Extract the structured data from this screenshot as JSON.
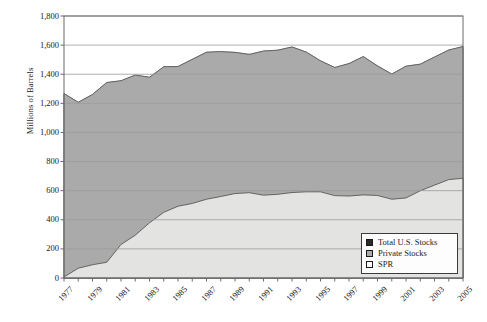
{
  "chart_data": {
    "type": "area",
    "stacked": true,
    "title": "",
    "xlabel": "",
    "ylabel": "Millions of Barrels",
    "ylim": [
      0,
      1800
    ],
    "ytick_step": 200,
    "yticks": [
      "0",
      "200",
      "400",
      "600",
      "800",
      "1,000",
      "1,200",
      "1,400",
      "1,600",
      "1,800"
    ],
    "grid": "horizontal",
    "legend_position": "bottom-right",
    "x": [
      1977,
      1978,
      1979,
      1980,
      1981,
      1982,
      1983,
      1984,
      1985,
      1986,
      1987,
      1988,
      1989,
      1990,
      1991,
      1992,
      1993,
      1994,
      1995,
      1996,
      1997,
      1998,
      1999,
      2000,
      2001,
      2002,
      2003,
      2004,
      2005
    ],
    "xtick_labels": [
      "1977",
      "1979",
      "1981",
      "1983",
      "1985",
      "1987",
      "1989",
      "1991",
      "1993",
      "1995",
      "1997",
      "1999",
      "2001",
      "2003",
      "2005"
    ],
    "xtick_label_years": [
      1977,
      1979,
      1981,
      1983,
      1985,
      1987,
      1989,
      1991,
      1993,
      1995,
      1997,
      1999,
      2001,
      2003,
      2005
    ],
    "series": [
      {
        "name": "SPR",
        "color": "#e3e3e1",
        "values": [
          7,
          67,
          91,
          108,
          230,
          294,
          379,
          451,
          493,
          512,
          541,
          560,
          580,
          586,
          569,
          575,
          587,
          592,
          592,
          566,
          563,
          571,
          567,
          541,
          550,
          599,
          638,
          676,
          685
        ]
      },
      {
        "name": "Private Stocks",
        "color": "#aaaaaa",
        "values": [
          1260,
          1140,
          1170,
          1235,
          1125,
          1100,
          1000,
          1000,
          960,
          990,
          1010,
          995,
          970,
          950,
          990,
          990,
          1000,
          960,
          900,
          880,
          910,
          950,
          890,
          860,
          905,
          870,
          880,
          890,
          905
        ]
      },
      {
        "name": "Total U.S. Stocks",
        "color": "#4a4a4a",
        "values": [
          1267,
          1207,
          1261,
          1343,
          1355,
          1394,
          1379,
          1451,
          1453,
          1502,
          1551,
          1555,
          1550,
          1536,
          1559,
          1565,
          1587,
          1552,
          1492,
          1446,
          1473,
          1521,
          1457,
          1401,
          1455,
          1469,
          1518,
          1566,
          1590
        ]
      }
    ],
    "legend": [
      {
        "label": "Total U.S. Stocks",
        "swatch": "#2a2a2a",
        "border": "#1a1a1a"
      },
      {
        "label": "Private Stocks",
        "swatch": "#aaaaaa",
        "border": "#1a1a1a"
      },
      {
        "label": "SPR",
        "swatch": "#fbfbfb",
        "border": "#1a1a1a"
      }
    ],
    "axis_color": "#6b6b6b",
    "grid_color": "#9a9a9a",
    "plot_background": "#ffffff"
  }
}
